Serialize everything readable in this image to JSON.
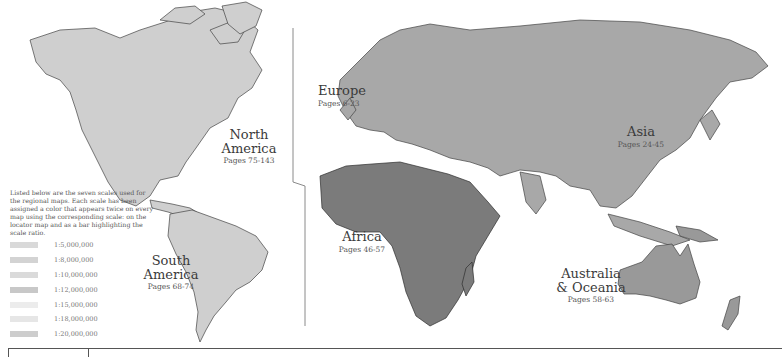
{
  "regions": [
    {
      "id": "north-america",
      "name_line1": "North",
      "name_line2": "America",
      "pages": "Pages 75-143",
      "color": "#cfcfcf"
    },
    {
      "id": "south-america",
      "name_line1": "South",
      "name_line2": "America",
      "pages": "Pages 68-74",
      "color": "#cfcfcf"
    },
    {
      "id": "europe",
      "name_line1": "Europe",
      "name_line2": "",
      "pages": "Pages 6-23",
      "color": "#a8a8a8"
    },
    {
      "id": "asia",
      "name_line1": "Asia",
      "name_line2": "",
      "pages": "Pages 24-45",
      "color": "#a8a8a8"
    },
    {
      "id": "africa",
      "name_line1": "Africa",
      "name_line2": "",
      "pages": "Pages 46-57",
      "color": "#7b7b7b"
    },
    {
      "id": "australia-oceania",
      "name_line1": "Australia",
      "name_line2": "& Oceania",
      "pages": "Pages 58-63",
      "color": "#999999"
    }
  ],
  "legend": {
    "intro": "Listed below are the seven scales used for the regional maps. Each scale has been assigned a color that appears twice on every map using the corresponding scale: on the locator map and as a bar highlighting the scale ratio.",
    "scales": [
      {
        "label": "1:5,000,000",
        "color": "#d9d9d9"
      },
      {
        "label": "1:8,000,000",
        "color": "#d3d3d3"
      },
      {
        "label": "1:10,000,000",
        "color": "#dadada"
      },
      {
        "label": "1:12,000,000",
        "color": "#c8c8c8"
      },
      {
        "label": "1:15,000,000",
        "color": "#ececec"
      },
      {
        "label": "1:18,000,000",
        "color": "#e6e6e6"
      },
      {
        "label": "1:20,000,000",
        "color": "#cdcdcd"
      }
    ]
  },
  "colors": {
    "border": "#3a3a3a",
    "divider": "#888888"
  }
}
